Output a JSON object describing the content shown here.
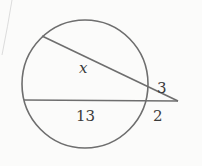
{
  "diagram": {
    "type": "circle-with-two-secants",
    "colors": {
      "stroke": "#6e6e6e",
      "text": "#3a3a3a",
      "background": "#fbfbfa"
    },
    "labels": {
      "upper_internal_segment": "x",
      "upper_external_segment": "3",
      "lower_internal_segment": "13",
      "lower_external_segment": "2"
    }
  }
}
